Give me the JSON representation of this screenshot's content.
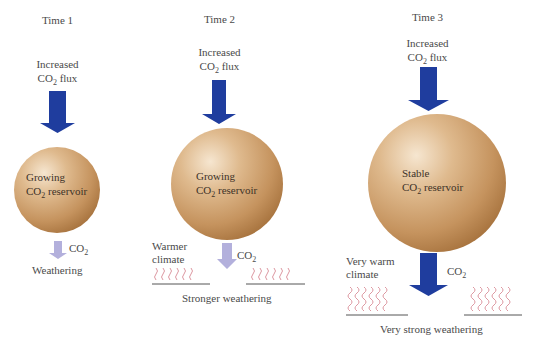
{
  "diagram": {
    "stages": [
      {
        "time_label": "Time 1",
        "input_label_line1": "Increased",
        "input_label_line2_prefix": "CO",
        "input_label_line2_sub": "2",
        "input_label_line2_suffix": " flux",
        "reservoir_line1": "Growing",
        "reservoir_line2_prefix": "CO",
        "reservoir_line2_sub": "2",
        "reservoir_line2_suffix": " reservoir",
        "output_label_prefix": "CO",
        "output_label_sub": "2",
        "climate_label_line1": "",
        "climate_label_line2": "",
        "weathering_label": "Weathering"
      },
      {
        "time_label": "Time 2",
        "input_label_line1": "Increased",
        "input_label_line2_prefix": "CO",
        "input_label_line2_sub": "2",
        "input_label_line2_suffix": " flux",
        "reservoir_line1": "Growing",
        "reservoir_line2_prefix": "CO",
        "reservoir_line2_sub": "2",
        "reservoir_line2_suffix": " reservoir",
        "output_label_prefix": "CO",
        "output_label_sub": "2",
        "climate_label_line1": "Warmer",
        "climate_label_line2": "climate",
        "weathering_label": "Stronger weathering"
      },
      {
        "time_label": "Time 3",
        "input_label_line1": "Increased",
        "input_label_line2_prefix": "CO",
        "input_label_line2_sub": "2",
        "input_label_line2_suffix": " flux",
        "reservoir_line1": "Stable",
        "reservoir_line2_prefix": "CO",
        "reservoir_line2_sub": "2",
        "reservoir_line2_suffix": " reservoir",
        "output_label_prefix": "CO",
        "output_label_sub": "2",
        "climate_label_line1": "Very warm",
        "climate_label_line2": "climate",
        "weathering_label": "Very strong weathering"
      }
    ],
    "colors": {
      "input_arrow": "#1f3d9e",
      "output_arrow_weak": "#b3b0dc",
      "output_arrow_strong": "#1f3d9e",
      "sphere_light": "#f3dcc0",
      "sphere_mid": "#d2a474",
      "sphere_dark": "#b07a45",
      "heat_waves": "#d88b95",
      "ground_line": "#555555",
      "text": "#4a4a4a"
    }
  }
}
